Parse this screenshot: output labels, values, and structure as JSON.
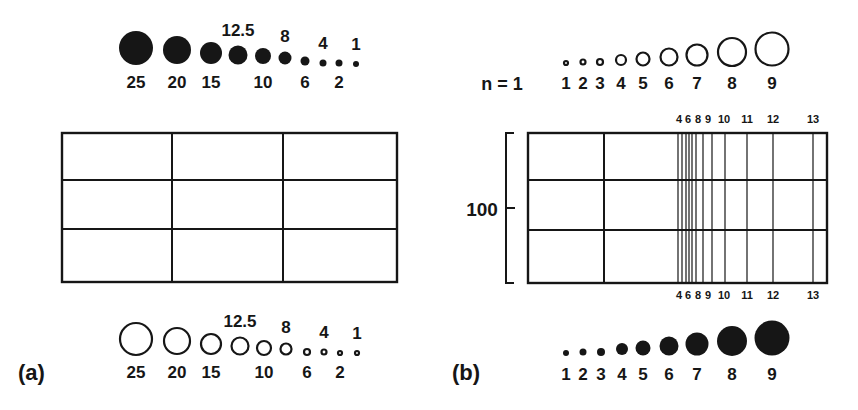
{
  "panel_a": {
    "label": "(a)",
    "top_legend": {
      "style": "filled",
      "items": [
        {
          "value": "25",
          "cx": 136,
          "cy": 48,
          "r": 17,
          "label_pos": "below"
        },
        {
          "value": "20",
          "cx": 177,
          "cy": 50,
          "r": 14,
          "label_pos": "below"
        },
        {
          "value": "15",
          "cx": 211,
          "cy": 53,
          "r": 11,
          "label_pos": "below"
        },
        {
          "value": "12.5",
          "cx": 238,
          "cy": 55,
          "r": 9.5,
          "label_pos": "above"
        },
        {
          "value": "10",
          "cx": 263,
          "cy": 56,
          "r": 8,
          "label_pos": "below"
        },
        {
          "value": "8",
          "cx": 285,
          "cy": 58,
          "r": 6.5,
          "label_pos": "above"
        },
        {
          "value": "6",
          "cx": 305,
          "cy": 61,
          "r": 4.5,
          "label_pos": "below"
        },
        {
          "value": "4",
          "cx": 323,
          "cy": 63,
          "r": 3.5,
          "label_pos": "above"
        },
        {
          "value": "2",
          "cx": 339,
          "cy": 63,
          "r": 3.5,
          "label_pos": "below"
        },
        {
          "value": "1",
          "cx": 356,
          "cy": 64,
          "r": 3,
          "label_pos": "above"
        }
      ]
    },
    "bottom_legend": {
      "style": "hollow",
      "items": [
        {
          "value": "25",
          "cx": 136,
          "cy": 339,
          "r": 17,
          "label_pos": "below"
        },
        {
          "value": "20",
          "cx": 177,
          "cy": 341,
          "r": 14,
          "label_pos": "below"
        },
        {
          "value": "15",
          "cx": 211,
          "cy": 344,
          "r": 11,
          "label_pos": "below"
        },
        {
          "value": "12.5",
          "cx": 240,
          "cy": 346,
          "r": 9.5,
          "label_pos": "above"
        },
        {
          "value": "10",
          "cx": 264,
          "cy": 348,
          "r": 8,
          "label_pos": "below"
        },
        {
          "value": "8",
          "cx": 286,
          "cy": 349,
          "r": 6.5,
          "label_pos": "above"
        },
        {
          "value": "6",
          "cx": 307,
          "cy": 352,
          "r": 4,
          "label_pos": "below"
        },
        {
          "value": "4",
          "cx": 324,
          "cy": 352,
          "r": 3.5,
          "label_pos": "above"
        },
        {
          "value": "2",
          "cx": 340,
          "cy": 353,
          "r": 3,
          "label_pos": "below"
        },
        {
          "value": "1",
          "cx": 357,
          "cy": 353,
          "r": 3,
          "label_pos": "above"
        }
      ]
    },
    "grid": {
      "x": 62,
      "y": 133,
      "width": 335,
      "height": 149,
      "col_lines": [
        172,
        283
      ],
      "row_lines": [
        180,
        229
      ]
    }
  },
  "panel_b": {
    "label": "(b)",
    "n_label": "n = 1",
    "top_legend": {
      "style": "hollow",
      "items": [
        {
          "value": "1",
          "cx": 566,
          "cy": 63,
          "r": 3
        },
        {
          "value": "2",
          "cx": 583,
          "cy": 62,
          "r": 3.5
        },
        {
          "value": "3",
          "cx": 600,
          "cy": 62,
          "r": 4
        },
        {
          "value": "4",
          "cx": 621,
          "cy": 60,
          "r": 6
        },
        {
          "value": "5",
          "cx": 643,
          "cy": 59,
          "r": 7.5
        },
        {
          "value": "6",
          "cx": 669,
          "cy": 57,
          "r": 9.5
        },
        {
          "value": "7",
          "cx": 697,
          "cy": 55,
          "r": 11.5
        },
        {
          "value": "8",
          "cx": 732,
          "cy": 52,
          "r": 15
        },
        {
          "value": "9",
          "cx": 772,
          "cy": 49,
          "r": 17.5
        }
      ]
    },
    "bottom_legend": {
      "style": "filled",
      "items": [
        {
          "value": "1",
          "cx": 566,
          "cy": 353,
          "r": 3
        },
        {
          "value": "2",
          "cx": 583,
          "cy": 352,
          "r": 3.5
        },
        {
          "value": "3",
          "cx": 601,
          "cy": 352,
          "r": 4
        },
        {
          "value": "4",
          "cx": 622,
          "cy": 349,
          "r": 6
        },
        {
          "value": "5",
          "cx": 643,
          "cy": 348,
          "r": 7.5
        },
        {
          "value": "6",
          "cx": 669,
          "cy": 346,
          "r": 9.5
        },
        {
          "value": "7",
          "cx": 697,
          "cy": 344,
          "r": 11.5
        },
        {
          "value": "8",
          "cx": 732,
          "cy": 341,
          "r": 15
        },
        {
          "value": "9",
          "cx": 772,
          "cy": 338,
          "r": 17.5
        }
      ]
    },
    "axis": {
      "tick_label": "100",
      "bracket_x": 506,
      "bracket_top": 133,
      "bracket_bottom": 283,
      "tick_y": 208
    },
    "grid": {
      "x": 528,
      "y": 133,
      "width": 299,
      "height": 150,
      "main_col_line": 604,
      "row_lines": [
        180,
        230
      ],
      "dense_lines": [
        678,
        682,
        686,
        689,
        692,
        696,
        703,
        712,
        725,
        747,
        773,
        813
      ],
      "line_labels": [
        {
          "text": "4",
          "x": 679
        },
        {
          "text": "6",
          "x": 688
        },
        {
          "text": "8",
          "x": 698
        },
        {
          "text": "9",
          "x": 708
        },
        {
          "text": "10",
          "x": 724
        },
        {
          "text": "11",
          "x": 747
        },
        {
          "text": "12",
          "x": 773
        },
        {
          "text": "13",
          "x": 813
        }
      ],
      "top_labels_y": 114,
      "bottom_labels_y": 290
    }
  }
}
